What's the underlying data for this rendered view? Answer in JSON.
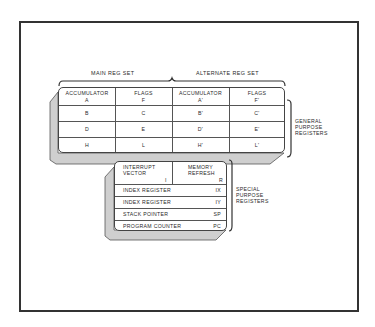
{
  "diagram": {
    "type": "register-set-diagram",
    "top_labels": {
      "main": "MAIN REG SET",
      "alternate": "ALTERNATE REG SET"
    },
    "general_purpose": {
      "label_lines": [
        "GENERAL",
        "PURPOSE",
        "REGISTERS"
      ],
      "columns": [
        {
          "header": "ACCUMULATOR",
          "reg": "A"
        },
        {
          "header": "FLAGS",
          "reg": "F"
        },
        {
          "header": "ACCUMULATOR",
          "reg": "A'"
        },
        {
          "header": "FLAGS",
          "reg": "F'"
        }
      ],
      "rows": [
        [
          "B",
          "C",
          "B'",
          "C'"
        ],
        [
          "D",
          "E",
          "D'",
          "E'"
        ],
        [
          "H",
          "L",
          "H'",
          "L'"
        ]
      ]
    },
    "special_purpose": {
      "label_lines": [
        "SPECIAL",
        "PURPOSE",
        "REGISTERS"
      ],
      "top_cells": [
        {
          "name_lines": [
            "INTERRUPT",
            "VECTOR"
          ],
          "reg": "I"
        },
        {
          "name_lines": [
            "MEMORY",
            "REFRESH"
          ],
          "reg": "R"
        }
      ],
      "rows": [
        {
          "name": "INDEX REGISTER",
          "reg": "IX"
        },
        {
          "name": "INDEX REGISTER",
          "reg": "IY"
        },
        {
          "name": "STACK POINTER",
          "reg": "SP"
        },
        {
          "name": "PROGRAM COUNTER",
          "reg": "PC"
        }
      ]
    }
  },
  "colors": {
    "line": "#444444",
    "slab": "#c8c8c8",
    "frame": "#333333"
  }
}
